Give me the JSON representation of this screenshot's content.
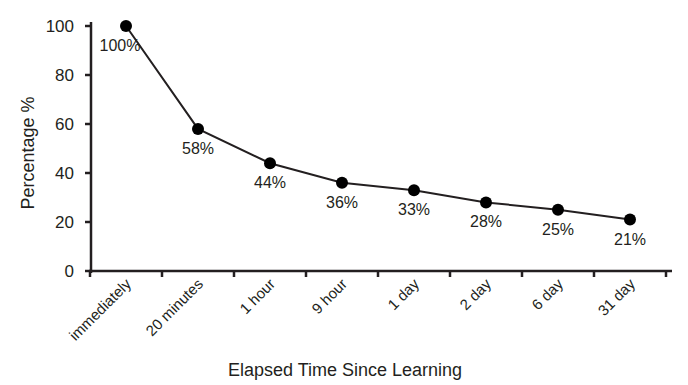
{
  "chart_data": {
    "type": "line",
    "title": "",
    "xlabel": "Elapsed Time Since Learning",
    "ylabel": "Percentage %",
    "categories": [
      "immediately",
      "20 minutes",
      "1 hour",
      "9 hour",
      "1 day",
      "2 day",
      "6 day",
      "31 day"
    ],
    "series": [
      {
        "name": "Retention",
        "values": [
          100,
          58,
          44,
          36,
          33,
          28,
          25,
          21
        ],
        "data_labels": [
          "100%",
          "58%",
          "44%",
          "36%",
          "33%",
          "28%",
          "25%",
          "21%"
        ]
      }
    ],
    "yticks": [
      0,
      20,
      40,
      60,
      80,
      100
    ],
    "ylim": [
      0,
      100
    ],
    "grid": false,
    "legend": "none",
    "marker": "filled-circle",
    "colors": {
      "line": "#231f20",
      "marker": "#000000",
      "axis": "#231f20"
    }
  }
}
